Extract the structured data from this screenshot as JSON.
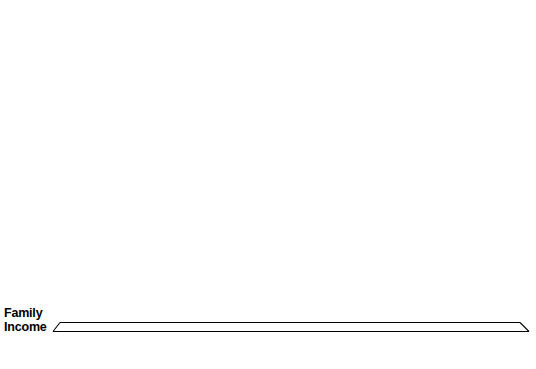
{
  "chart_data": {
    "type": "bar",
    "title": "",
    "subtitle": "",
    "xlabel": "Family Income",
    "ylabel": "",
    "grid": false,
    "legend": "none",
    "ylim": [
      0,
      2780
    ],
    "categories": [
      "Under\n$15,000",
      "$15,000-\n$19,999",
      "$20,000-\n$29,999",
      "$30,000-\n$39,999",
      "$40,000-\n$49,999",
      "$50,000-\n$74,999",
      "$75,000-\n$99,999",
      "$100,000-\nor More"
    ],
    "values": [
      102,
      292,
      725,
      1231,
      1448,
      2134,
      2640,
      2780
    ],
    "data_labels": [
      "$102",
      "$292",
      "$725",
      "$1,231",
      "$1,448",
      "$2,134",
      "$2,640",
      "$2,780"
    ],
    "colors": {
      "bar_face": "#ffffff",
      "bar_outline": "#1a1a1a",
      "bar_shadow": "#000000",
      "text": "#000000",
      "background": "#ffffff"
    }
  },
  "axis": {
    "family_income_line1": "Family",
    "family_income_line2": "Income"
  },
  "bars": [
    {
      "label": "$102",
      "cat1": "Under",
      "cat2": "$15,000"
    },
    {
      "label": "$292",
      "cat1": "$15,000-",
      "cat2": "$19,999"
    },
    {
      "label": "$725",
      "cat1": "$20,000-",
      "cat2": "$29,999"
    },
    {
      "label": "$1,231",
      "cat1": "$30,000-",
      "cat2": "$39,999"
    },
    {
      "label": "$1,448",
      "cat1": "$40,000-",
      "cat2": "$49,999"
    },
    {
      "label": "$2,134",
      "cat1": "$50,000-",
      "cat2": "$74,999"
    },
    {
      "label": "$2,640",
      "cat1": "$75,000-",
      "cat2": "$99,999"
    },
    {
      "label": "$2,780",
      "cat1": "$100,000-",
      "cat2": "or More"
    }
  ]
}
